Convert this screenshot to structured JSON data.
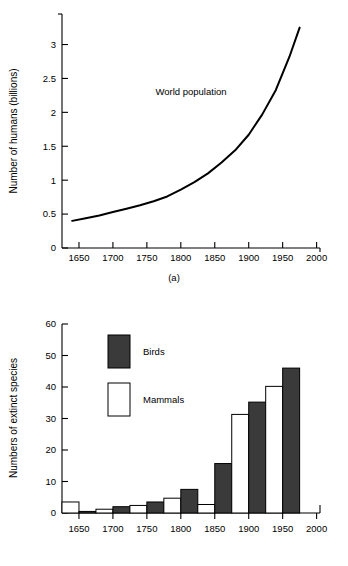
{
  "figure": {
    "caption_a": "(a)",
    "caption_b": "(b)"
  },
  "chart_data": [
    {
      "id": "world-population",
      "type": "line",
      "title": "",
      "xlabel": "",
      "ylabel": "Number of humans (billions)",
      "xlim": [
        1625,
        2005
      ],
      "ylim": [
        0,
        3.45
      ],
      "xticks": [
        1650,
        1700,
        1750,
        1800,
        1850,
        1900,
        1950,
        2000
      ],
      "xtick_labels": [
        "1650",
        "1700",
        "1750",
        "1800",
        "1850",
        "1900",
        "1950",
        "2000"
      ],
      "yticks": [
        0,
        0.5,
        1,
        1.5,
        2,
        2.5,
        3
      ],
      "ytick_labels": [
        "0",
        "0.5",
        "1",
        "1.5",
        "2",
        "2.5",
        "3"
      ],
      "grid": false,
      "legend_position": "inline-annotation",
      "annotations": [
        {
          "text": "World population",
          "x": 1815,
          "y": 2.25
        }
      ],
      "series": [
        {
          "name": "World population",
          "x": [
            1640,
            1660,
            1680,
            1700,
            1720,
            1740,
            1760,
            1780,
            1800,
            1820,
            1840,
            1860,
            1880,
            1900,
            1920,
            1940,
            1960,
            1975
          ],
          "values": [
            0.4,
            0.44,
            0.48,
            0.53,
            0.58,
            0.63,
            0.69,
            0.76,
            0.86,
            0.97,
            1.1,
            1.26,
            1.44,
            1.67,
            1.97,
            2.33,
            2.82,
            3.25
          ]
        }
      ]
    },
    {
      "id": "extinct-species",
      "type": "bar",
      "title": "",
      "xlabel": "",
      "ylabel": "Numbers of extinct species",
      "xlim": [
        1625,
        2005
      ],
      "ylim": [
        0,
        60
      ],
      "xticks": [
        1650,
        1700,
        1750,
        1800,
        1850,
        1900,
        1950,
        2000
      ],
      "xtick_labels": [
        "1650",
        "1700",
        "1750",
        "1800",
        "1850",
        "1900",
        "1950",
        "2000"
      ],
      "yticks": [
        0,
        10,
        20,
        30,
        40,
        50,
        60
      ],
      "ytick_labels": [
        "0",
        "10",
        "20",
        "30",
        "40",
        "50",
        "60"
      ],
      "grid": false,
      "legend_position": "upper-left-inside",
      "categories": [
        "1625-1650",
        "1650-1675",
        "1675-1700",
        "1700-1725",
        "1725-1750",
        "1750-1775",
        "1775-1800",
        "1800-1825",
        "1825-1850",
        "1850-1875",
        "1875-1900",
        "1900-1925",
        "1925-1950",
        "1950-1975"
      ],
      "bin_starts": [
        1625,
        1650,
        1675,
        1700,
        1725,
        1750,
        1775,
        1800,
        1825,
        1850,
        1875,
        1900,
        1925,
        1950
      ],
      "bin_width": 25,
      "series": [
        {
          "name": "Mammals",
          "color": "#ffffff",
          "values": [
            3.5,
            null,
            1.2,
            null,
            2.4,
            null,
            4.7,
            null,
            2.7,
            null,
            31.3,
            null,
            40.2,
            null
          ]
        },
        {
          "name": "Birds",
          "color": "#3a3a3a",
          "values": [
            null,
            0.5,
            null,
            2.0,
            null,
            3.5,
            null,
            7.5,
            null,
            15.7,
            null,
            35.2,
            null,
            46.0
          ]
        }
      ],
      "bars": [
        {
          "bin_start": 1625,
          "series": "Mammals",
          "value": 3.5
        },
        {
          "bin_start": 1650,
          "series": "Birds",
          "value": 0.5
        },
        {
          "bin_start": 1675,
          "series": "Mammals",
          "value": 1.2
        },
        {
          "bin_start": 1700,
          "series": "Birds",
          "value": 2.0
        },
        {
          "bin_start": 1725,
          "series": "Mammals",
          "value": 2.4
        },
        {
          "bin_start": 1750,
          "series": "Birds",
          "value": 3.5
        },
        {
          "bin_start": 1775,
          "series": "Mammals",
          "value": 4.7
        },
        {
          "bin_start": 1800,
          "series": "Birds",
          "value": 7.5
        },
        {
          "bin_start": 1825,
          "series": "Mammals",
          "value": 2.7
        },
        {
          "bin_start": 1850,
          "series": "Birds",
          "value": 15.7
        },
        {
          "bin_start": 1875,
          "series": "Mammals",
          "value": 31.3
        },
        {
          "bin_start": 1900,
          "series": "Birds",
          "value": 35.2
        },
        {
          "bin_start": 1925,
          "series": "Mammals",
          "value": 40.2
        },
        {
          "bin_start": 1950,
          "series": "Birds",
          "value": 46.0
        }
      ],
      "legend": [
        {
          "label": "Birds",
          "color": "#3a3a3a"
        },
        {
          "label": "Mammals",
          "color": "#ffffff"
        }
      ]
    }
  ]
}
